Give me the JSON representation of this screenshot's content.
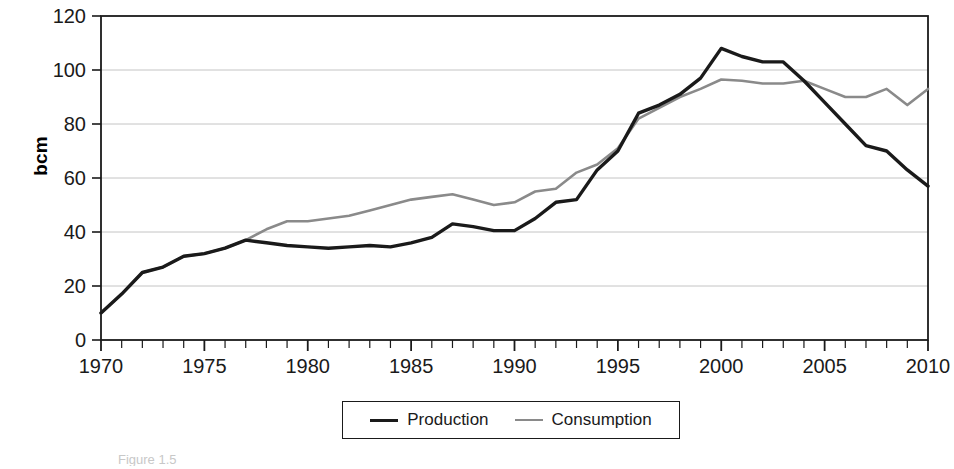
{
  "chart_data": {
    "type": "line",
    "title": "",
    "subtitle": "",
    "xlabel": "",
    "ylabel": "bcm",
    "xlim": [
      1970,
      2010
    ],
    "ylim": [
      0,
      120
    ],
    "ytick_step": 20,
    "yticks": [
      0,
      20,
      40,
      60,
      80,
      100,
      120
    ],
    "xticks": [
      1970,
      1975,
      1980,
      1985,
      1990,
      1995,
      2000,
      2005,
      2010
    ],
    "xtick_minor_step": 1,
    "grid": "horizontal",
    "legend_position": "bottom-center",
    "x": [
      1970,
      1971,
      1972,
      1973,
      1974,
      1975,
      1976,
      1977,
      1978,
      1979,
      1980,
      1981,
      1982,
      1983,
      1984,
      1985,
      1986,
      1987,
      1988,
      1989,
      1990,
      1991,
      1992,
      1993,
      1994,
      1995,
      1996,
      1997,
      1998,
      1999,
      2000,
      2001,
      2002,
      2003,
      2004,
      2005,
      2006,
      2007,
      2008,
      2009,
      2010
    ],
    "series": [
      {
        "name": "Production",
        "color": "#1a1a1a",
        "values": [
          10,
          17,
          25,
          27,
          31,
          32,
          34,
          37,
          36,
          35,
          34.5,
          34,
          34.5,
          35,
          34.5,
          36,
          38,
          43,
          42,
          40.5,
          40.5,
          45,
          51,
          52,
          63,
          70,
          84,
          87,
          91,
          97,
          108,
          105,
          103,
          103,
          96,
          88,
          80,
          72,
          70,
          63,
          57
        ]
      },
      {
        "name": "Consumption",
        "color": "#8a8a8a",
        "values": [
          10,
          17,
          25,
          27,
          31,
          32,
          34,
          37,
          41,
          44,
          44,
          45,
          46,
          48,
          50,
          52,
          53,
          54,
          52,
          50,
          51,
          55,
          56,
          62,
          65,
          71,
          82,
          86,
          90,
          93,
          96.5,
          96,
          95,
          95,
          96,
          93,
          90,
          90,
          93,
          87,
          93
        ]
      }
    ]
  },
  "axis": {
    "y_label": "bcm",
    "y_tick_labels": [
      "0",
      "20",
      "40",
      "60",
      "80",
      "100",
      "120"
    ],
    "x_tick_labels": [
      "1970",
      "1975",
      "1980",
      "1985",
      "1990",
      "1995",
      "2000",
      "2005",
      "2010"
    ]
  },
  "legend": {
    "entries": [
      {
        "label": "Production",
        "color": "#1a1a1a"
      },
      {
        "label": "Consumption",
        "color": "#8a8a8a"
      }
    ]
  },
  "caption": {
    "text": "Figure 1.5"
  }
}
